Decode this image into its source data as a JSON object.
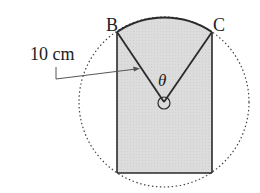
{
  "diagram": {
    "labels": {
      "point_b": "B",
      "point_c": "C",
      "length": "10 cm",
      "angle": "θ"
    },
    "colors": {
      "shade": "#d9d9d9",
      "stroke": "#2a2a2a",
      "dotted": "#444444"
    },
    "geometry": {
      "circle_center": [
        164,
        102
      ],
      "circle_radius": 85,
      "point_b": [
        117,
        32
      ],
      "point_c": [
        212,
        32
      ],
      "rect_bottom_y": 173
    }
  }
}
